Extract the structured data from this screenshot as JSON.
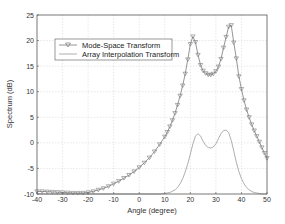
{
  "chart_data": {
    "type": "line",
    "title": "",
    "xlabel": "Angle (degree)",
    "ylabel": "Spectrum (dB)",
    "xlim": [
      -40,
      50
    ],
    "ylim": [
      -10,
      25
    ],
    "xticks": [
      -40,
      -30,
      -20,
      -10,
      0,
      10,
      20,
      30,
      40,
      50
    ],
    "yticks": [
      -10,
      -5,
      0,
      5,
      10,
      15,
      20,
      25
    ],
    "grid": true,
    "legend_position": "upper-left",
    "series": [
      {
        "name": "Mode-Space Transform",
        "style": "line-with-triangle-markers",
        "color": "#7a7a7a",
        "x": [
          -40,
          -38,
          -36,
          -34,
          -32,
          -30,
          -28,
          -26,
          -24,
          -22,
          -20,
          -18,
          -16,
          -14,
          -12,
          -10,
          -8,
          -6,
          -4,
          -2,
          0,
          2,
          4,
          6,
          8,
          10,
          11,
          12,
          13,
          14,
          15,
          16,
          17,
          18,
          19,
          20,
          21,
          22,
          23,
          24,
          25,
          26,
          27,
          28,
          29,
          30,
          31,
          32,
          33,
          34,
          35,
          36,
          37,
          38,
          39,
          40,
          41,
          42,
          43,
          44,
          45,
          46,
          47,
          48,
          49,
          50
        ],
        "y": [
          -9.5,
          -9.5,
          -9.55,
          -9.6,
          -9.65,
          -9.7,
          -9.75,
          -9.8,
          -9.8,
          -9.8,
          -9.7,
          -9.5,
          -9.2,
          -8.9,
          -8.5,
          -8.0,
          -7.5,
          -6.9,
          -6.3,
          -5.6,
          -4.8,
          -3.9,
          -2.9,
          -1.7,
          -0.3,
          1.2,
          2.1,
          3.2,
          4.4,
          5.8,
          7.4,
          9.2,
          11.2,
          13.5,
          16.3,
          19.3,
          20.8,
          19.7,
          17.2,
          15.2,
          14.1,
          13.6,
          13.3,
          13.3,
          13.5,
          14.0,
          14.9,
          16.4,
          18.6,
          20.7,
          22.7,
          23.0,
          19.6,
          16.5,
          13.0,
          10.5,
          8.3,
          6.5,
          5.0,
          3.6,
          2.4,
          1.3,
          0.2,
          -0.9,
          -2.0,
          -3.0
        ]
      },
      {
        "name": "Array Interpolation Transform",
        "style": "line",
        "color": "#9a9a9a",
        "x": [
          -40,
          -20,
          0,
          5,
          8,
          10,
          12,
          14,
          15,
          16,
          17,
          18,
          19,
          20,
          21,
          22,
          23,
          24,
          25,
          26,
          27,
          28,
          29,
          30,
          31,
          32,
          33,
          34,
          35,
          36,
          37,
          38,
          39,
          40,
          41,
          42,
          43,
          44,
          45,
          46,
          47,
          48,
          49,
          50
        ],
        "y": [
          -10,
          -10,
          -10,
          -10,
          -10,
          -9.9,
          -9.7,
          -9.2,
          -8.7,
          -8.0,
          -7.0,
          -5.7,
          -4.1,
          -2.2,
          -0.2,
          1.3,
          1.8,
          1.3,
          0.3,
          -0.5,
          -0.9,
          -1.0,
          -0.8,
          -0.2,
          0.8,
          1.8,
          2.4,
          2.5,
          2.0,
          0.5,
          -1.6,
          -3.8,
          -5.6,
          -7.0,
          -8.0,
          -8.7,
          -9.2,
          -9.5,
          -9.7,
          -9.8,
          -9.9,
          -10,
          -10,
          -10
        ]
      }
    ]
  }
}
